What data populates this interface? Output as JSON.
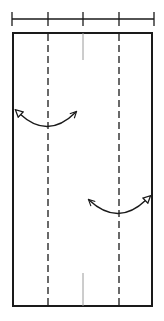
{
  "diagram": {
    "type": "fold-instruction",
    "colors": {
      "stroke": "#1a1a1a",
      "center_line": "#9a9a9a",
      "background": "#ffffff"
    },
    "ruler": {
      "y": 19,
      "x_start": 12,
      "x_end": 154,
      "ticks": [
        12,
        48,
        83,
        119,
        154
      ],
      "tick_half_height": 7
    },
    "panel": {
      "x": 13,
      "y": 33,
      "width": 139,
      "height": 273
    },
    "fold_lines": [
      {
        "x": 48,
        "style": "dashed"
      },
      {
        "x": 119,
        "style": "dashed"
      }
    ],
    "center_marks": [
      {
        "x": 83,
        "y1": 33,
        "y2": 60
      },
      {
        "x": 83,
        "y1": 273,
        "y2": 306
      }
    ],
    "arrows": [
      {
        "name": "left-fold-arrow",
        "path": "M20 114 Q48 140 76 112",
        "hollow_end": "start",
        "open_end": "end"
      },
      {
        "name": "right-fold-arrow",
        "path": "M89 200 Q118 227 146 200",
        "hollow_end": "end",
        "open_end": "start"
      }
    ]
  }
}
